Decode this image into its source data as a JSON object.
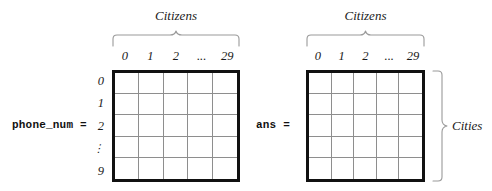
{
  "figure": {
    "background_color": "#ffffff",
    "grid_border_color": "#111111",
    "grid_line_color": "#8e8e8e",
    "brace_color": "#9a9a9a"
  },
  "column_labels": [
    "0",
    "1",
    "2",
    "...",
    "29"
  ],
  "row_labels": [
    "0",
    "1",
    "2",
    "⋮",
    "9"
  ],
  "panels": [
    {
      "id": "phone_num",
      "var_label": "phone_num =",
      "top_axis_title": "Citizens",
      "side_axis_title": "",
      "rows": 5,
      "cols": 5,
      "has_row_labels": true,
      "has_side_brace": false
    },
    {
      "id": "ans",
      "var_label": "ans =",
      "top_axis_title": "Citizens",
      "side_axis_title": "Cities",
      "rows": 5,
      "cols": 5,
      "has_row_labels": false,
      "has_side_brace": true
    }
  ]
}
